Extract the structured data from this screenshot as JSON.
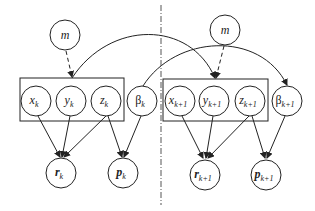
{
  "diagram": {
    "type": "graphical-model",
    "time_slices": [
      {
        "id": "k",
        "prior_node": {
          "label": "m"
        },
        "plate_nodes": [
          {
            "name": "x",
            "sub": "k"
          },
          {
            "name": "y",
            "sub": "k"
          },
          {
            "name": "z",
            "sub": "k"
          }
        ],
        "beta_node": {
          "name": "β",
          "sub": "k"
        },
        "observations": [
          {
            "name": "r",
            "sub": "k"
          },
          {
            "name": "p",
            "sub": "k"
          }
        ]
      },
      {
        "id": "k+1",
        "prior_node": {
          "label": "m"
        },
        "plate_nodes": [
          {
            "name": "x",
            "sub": "k+1"
          },
          {
            "name": "y",
            "sub": "k+1"
          },
          {
            "name": "z",
            "sub": "k+1"
          }
        ],
        "beta_node": {
          "name": "β",
          "sub": "k+1"
        },
        "observations": [
          {
            "name": "r",
            "sub": "k+1"
          },
          {
            "name": "p",
            "sub": "k+1"
          }
        ]
      }
    ],
    "edges": [
      {
        "from": "m_k",
        "to": "plate_k",
        "style": "dashed"
      },
      {
        "from": "x_k",
        "to": "r_k"
      },
      {
        "from": "y_k",
        "to": "r_k"
      },
      {
        "from": "z_k",
        "to": "r_k"
      },
      {
        "from": "z_k",
        "to": "p_k"
      },
      {
        "from": "β_k",
        "to": "p_k"
      },
      {
        "from": "plate_k",
        "to": "plate_k+1",
        "style": "curved"
      },
      {
        "from": "β_k",
        "to": "β_k+1",
        "style": "curved"
      },
      {
        "from": "m_k+1",
        "to": "plate_k+1",
        "style": "dashed"
      },
      {
        "from": "x_k+1",
        "to": "r_k+1"
      },
      {
        "from": "y_k+1",
        "to": "r_k+1"
      },
      {
        "from": "z_k+1",
        "to": "r_k+1"
      },
      {
        "from": "z_k+1",
        "to": "p_k+1"
      },
      {
        "from": "β_k+1",
        "to": "p_k+1"
      }
    ],
    "separator": "dash-dot vertical line"
  }
}
